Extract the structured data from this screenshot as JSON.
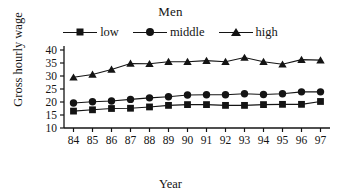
{
  "figure": {
    "title": "Men",
    "xlabel": "Year",
    "ylabel": "Gross hourly wage"
  },
  "legend": {
    "items": [
      {
        "label": "low",
        "marker": "square-marker"
      },
      {
        "label": "middle",
        "marker": "circle-marker"
      },
      {
        "label": "high",
        "marker": "triangle-marker"
      }
    ]
  },
  "axes": {
    "y_ticks": [
      "40",
      "35",
      "30",
      "25",
      "20",
      "15",
      "10"
    ],
    "x_ticks": [
      "84",
      "85",
      "86",
      "87",
      "88",
      "89",
      "90",
      "91",
      "92",
      "93",
      "94",
      "95",
      "96",
      "97"
    ]
  },
  "colors": {
    "ink": "#141414",
    "background": "#ffffff"
  },
  "chart_data": {
    "type": "line",
    "title": "Men",
    "xlabel": "Year",
    "ylabel": "Gross hourly wage",
    "x": [
      84,
      85,
      86,
      87,
      88,
      89,
      90,
      91,
      92,
      93,
      94,
      95,
      96,
      97
    ],
    "categories": [
      "84",
      "85",
      "86",
      "87",
      "88",
      "89",
      "90",
      "91",
      "92",
      "93",
      "94",
      "95",
      "96",
      "97"
    ],
    "series": [
      {
        "name": "low",
        "marker": "square",
        "values": [
          16.5,
          17.0,
          17.5,
          17.6,
          18.1,
          18.7,
          19.0,
          19.0,
          18.7,
          18.7,
          19.0,
          19.1,
          19.1,
          20.2
        ]
      },
      {
        "name": "middle",
        "marker": "circle",
        "values": [
          19.6,
          20.1,
          20.4,
          21.0,
          21.6,
          22.0,
          22.7,
          22.8,
          22.8,
          23.2,
          22.9,
          23.2,
          23.9,
          23.9
        ]
      },
      {
        "name": "high",
        "marker": "triangle",
        "values": [
          29.5,
          30.6,
          32.5,
          34.8,
          34.7,
          35.5,
          35.5,
          35.9,
          35.5,
          37.1,
          35.5,
          34.5,
          36.3,
          36.1
        ]
      }
    ],
    "xlim": [
      83.5,
      97.5
    ],
    "ylim": [
      10,
      40
    ],
    "ytick_values": [
      10,
      15,
      20,
      25,
      30,
      35,
      40
    ],
    "grid": false,
    "legend_position": "top-center"
  }
}
